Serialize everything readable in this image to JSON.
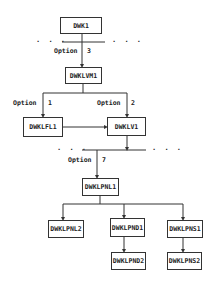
{
  "nodes": {
    "dwk1": "DWK1",
    "dwklvm1": "DWKLVM1",
    "dwklfl1": "DWKLFL1",
    "dwklv1": "DWKLV1",
    "dwklpnl1": "DWKLPNL1",
    "dwklpnl2": "DWKLPNL2",
    "dwklpnd1": "DWKLPND1",
    "dwklpns1": "DWKLPNS1",
    "dwklpnd2": "DWKLPND2",
    "dwklpns2": "DWKLPNS2"
  },
  "options": {
    "opt3_label": "Option",
    "opt3_num": "3",
    "opt1_label": "Option",
    "opt1_num": "1",
    "opt2_label": "Option",
    "opt2_num": "2",
    "opt7_label": "Option",
    "opt7_num": "7"
  },
  "ellipsis": ". . .",
  "edges": [
    [
      "DWK1",
      "DWKLVM1",
      "Option 3"
    ],
    [
      "DWKLVM1",
      "DWKLFL1",
      "Option 1"
    ],
    [
      "DWKLVM1",
      "DWKLV1",
      "Option 2"
    ],
    [
      "DWKLFL1",
      "DWKLV1",
      ""
    ],
    [
      "DWKLV1",
      "DWKLPNL1",
      "Option 7"
    ],
    [
      "DWKLPNL1",
      "DWKLPNL2",
      ""
    ],
    [
      "DWKLPNL1",
      "DWKLPND1",
      ""
    ],
    [
      "DWKLPNL1",
      "DWKLPNS1",
      ""
    ],
    [
      "DWKLPND1",
      "DWKLPND2",
      ""
    ],
    [
      "DWKLPNS1",
      "DWKLPNS2",
      ""
    ]
  ]
}
